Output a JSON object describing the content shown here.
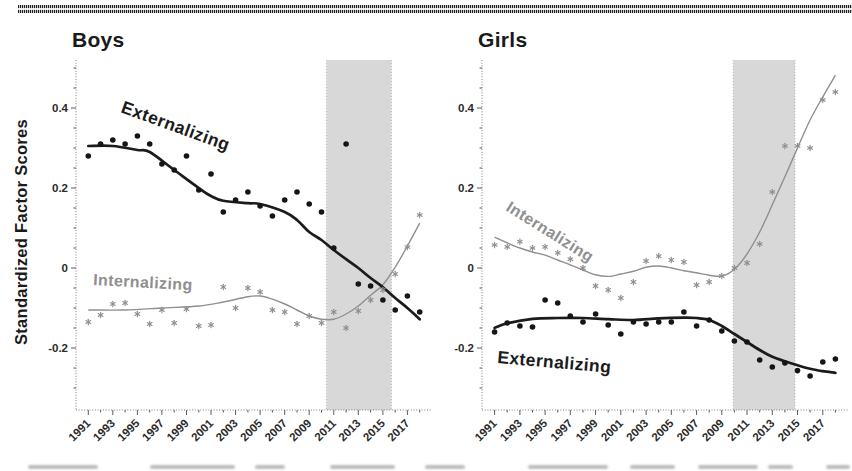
{
  "figure": {
    "ylabel": "Standardized Factor Scores",
    "panel_titles": [
      "Boys",
      "Girls"
    ],
    "curve_labels": [
      "Externalizing",
      "Internalizing"
    ],
    "ytick_labels": [
      "-0.2",
      "0",
      "0.2",
      "0.4"
    ],
    "xtick_labels": [
      "1991",
      "1993",
      "1995",
      "1997",
      "1999",
      "2001",
      "2003",
      "2005",
      "2007",
      "2009",
      "2011",
      "2013",
      "2015",
      "2017"
    ],
    "colors": {
      "externalizing": "#1b1b1b",
      "internalizing": "#8f8f8f",
      "shaded_band": "#d8d8d8"
    }
  },
  "chart_data": [
    {
      "type": "scatter",
      "title": "Boys",
      "xlabel": "",
      "ylabel": "Standardized Factor Scores",
      "x_range": [
        1990,
        2019
      ],
      "ylim": [
        -0.355,
        0.52
      ],
      "yticks": [
        -0.2,
        0,
        0.2,
        0.4
      ],
      "xticks": [
        1991,
        1993,
        1995,
        1997,
        1999,
        2001,
        2003,
        2005,
        2007,
        2009,
        2011,
        2013,
        2015,
        2017
      ],
      "grid": false,
      "legend": "inline curve labels",
      "shaded_region": {
        "from": 2010.4,
        "to": 2015.7
      },
      "years": [
        1991,
        1992,
        1993,
        1994,
        1995,
        1996,
        1997,
        1998,
        1999,
        2000,
        2001,
        2002,
        2003,
        2004,
        2005,
        2006,
        2007,
        2008,
        2009,
        2010,
        2011,
        2012,
        2013,
        2014,
        2015,
        2016,
        2017,
        2018
      ],
      "series": [
        {
          "name": "Externalizing",
          "marker": "filled-circle",
          "color": "#1b1b1b",
          "values": [
            0.28,
            0.31,
            0.32,
            0.31,
            0.33,
            0.31,
            0.26,
            0.245,
            0.28,
            0.195,
            0.235,
            0.14,
            0.17,
            0.19,
            0.155,
            0.13,
            0.17,
            0.19,
            0.16,
            0.14,
            0.05,
            0.31,
            -0.04,
            -0.045,
            -0.08,
            -0.105,
            -0.07,
            -0.11
          ],
          "trend": [
            [
              1991,
              0.305
            ],
            [
              1993,
              0.305
            ],
            [
              1995,
              0.295
            ],
            [
              1996,
              0.29
            ],
            [
              1998,
              0.245
            ],
            [
              2000,
              0.2
            ],
            [
              2001,
              0.18
            ],
            [
              2002,
              0.168
            ],
            [
              2004,
              0.162
            ],
            [
              2005,
              0.16
            ],
            [
              2007,
              0.14
            ],
            [
              2008,
              0.12
            ],
            [
              2009,
              0.09
            ],
            [
              2010,
              0.07
            ],
            [
              2011,
              0.045
            ],
            [
              2012,
              0.022
            ],
            [
              2013,
              0.0
            ],
            [
              2014,
              -0.025
            ],
            [
              2015,
              -0.048
            ],
            [
              2016,
              -0.075
            ],
            [
              2017,
              -0.1
            ],
            [
              2018,
              -0.128
            ]
          ]
        },
        {
          "name": "Internalizing",
          "marker": "asterisk",
          "color": "#8f8f8f",
          "values": [
            -0.135,
            -0.1175,
            -0.09,
            -0.0875,
            -0.115,
            -0.14,
            -0.105,
            -0.1375,
            -0.1025,
            -0.145,
            -0.1425,
            -0.0475,
            -0.1,
            -0.05,
            -0.06,
            -0.105,
            -0.11,
            -0.14,
            -0.12,
            -0.1375,
            -0.11,
            -0.15,
            -0.1075,
            -0.08,
            -0.055,
            -0.015,
            0.0525,
            0.1325
          ],
          "trend": [
            [
              1991,
              -0.105
            ],
            [
              1994,
              -0.105
            ],
            [
              1997,
              -0.1
            ],
            [
              2000,
              -0.095
            ],
            [
              2002,
              -0.085
            ],
            [
              2004,
              -0.072
            ],
            [
              2005,
              -0.07
            ],
            [
              2006,
              -0.078
            ],
            [
              2007,
              -0.09
            ],
            [
              2008,
              -0.105
            ],
            [
              2009,
              -0.12
            ],
            [
              2010,
              -0.128
            ],
            [
              2011,
              -0.128
            ],
            [
              2012,
              -0.115
            ],
            [
              2013,
              -0.095
            ],
            [
              2014,
              -0.068
            ],
            [
              2015,
              -0.042
            ],
            [
              2016,
              0.002
            ],
            [
              2017,
              0.055
            ],
            [
              2018,
              0.112
            ]
          ]
        }
      ]
    },
    {
      "type": "scatter",
      "title": "Girls",
      "xlabel": "",
      "ylabel": "Standardized Factor Scores",
      "x_range": [
        1990,
        2019
      ],
      "ylim": [
        -0.355,
        0.52
      ],
      "yticks": [
        -0.2,
        0,
        0.2,
        0.4
      ],
      "xticks": [
        1991,
        1993,
        1995,
        1997,
        1999,
        2001,
        2003,
        2005,
        2007,
        2009,
        2011,
        2013,
        2015,
        2017
      ],
      "grid": false,
      "legend": "inline curve labels",
      "shaded_region": {
        "from": 2009.9,
        "to": 2014.8
      },
      "years": [
        1991,
        1992,
        1993,
        1994,
        1995,
        1996,
        1997,
        1998,
        1999,
        2000,
        2001,
        2002,
        2003,
        2004,
        2005,
        2006,
        2007,
        2008,
        2009,
        2010,
        2011,
        2012,
        2013,
        2014,
        2015,
        2016,
        2017,
        2018
      ],
      "series": [
        {
          "name": "Externalizing",
          "marker": "filled-circle",
          "color": "#1b1b1b",
          "values": [
            -0.16,
            -0.1375,
            -0.145,
            -0.1475,
            -0.08,
            -0.0875,
            -0.12,
            -0.135,
            -0.115,
            -0.1425,
            -0.165,
            -0.135,
            -0.14,
            -0.135,
            -0.135,
            -0.11,
            -0.145,
            -0.13,
            -0.1575,
            -0.1825,
            -0.185,
            -0.23,
            -0.2475,
            -0.2375,
            -0.2565,
            -0.27,
            -0.235,
            -0.2275
          ],
          "trend": [
            [
              1991,
              -0.15
            ],
            [
              1992,
              -0.138
            ],
            [
              1994,
              -0.127
            ],
            [
              1996,
              -0.125
            ],
            [
              1998,
              -0.125
            ],
            [
              2000,
              -0.128
            ],
            [
              2002,
              -0.13
            ],
            [
              2004,
              -0.126
            ],
            [
              2006,
              -0.124
            ],
            [
              2007,
              -0.125
            ],
            [
              2008,
              -0.13
            ],
            [
              2009,
              -0.145
            ],
            [
              2010,
              -0.165
            ],
            [
              2011,
              -0.185
            ],
            [
              2012,
              -0.205
            ],
            [
              2013,
              -0.222
            ],
            [
              2014,
              -0.233
            ],
            [
              2015,
              -0.243
            ],
            [
              2016,
              -0.252
            ],
            [
              2017,
              -0.258
            ],
            [
              2018,
              -0.262
            ]
          ]
        },
        {
          "name": "Internalizing",
          "marker": "asterisk",
          "color": "#8f8f8f",
          "values": [
            0.0575,
            0.053,
            0.066,
            0.05,
            0.053,
            0.038,
            0.022,
            0.0,
            -0.045,
            -0.055,
            -0.075,
            -0.035,
            0.0175,
            0.03,
            0.02,
            0.015,
            -0.0425,
            -0.035,
            -0.02,
            0.0,
            0.0125,
            0.06,
            0.19,
            0.305,
            0.305,
            0.3,
            0.42,
            0.44
          ],
          "trend": [
            [
              1991,
              0.077
            ],
            [
              1992,
              0.063
            ],
            [
              1993,
              0.05
            ],
            [
              1994,
              0.04
            ],
            [
              1995,
              0.032
            ],
            [
              1996,
              0.02
            ],
            [
              1997,
              0.008
            ],
            [
              1998,
              -0.005
            ],
            [
              1999,
              -0.017
            ],
            [
              2000,
              -0.021
            ],
            [
              2001,
              -0.015
            ],
            [
              2002,
              -0.008
            ],
            [
              2003,
              0.002
            ],
            [
              2004,
              0.005
            ],
            [
              2005,
              0.0
            ],
            [
              2006,
              -0.007
            ],
            [
              2007,
              -0.012
            ],
            [
              2008,
              -0.018
            ],
            [
              2009,
              -0.02
            ],
            [
              2010,
              -0.003
            ],
            [
              2011,
              0.035
            ],
            [
              2012,
              0.09
            ],
            [
              2013,
              0.158
            ],
            [
              2014,
              0.228
            ],
            [
              2015,
              0.3
            ],
            [
              2016,
              0.37
            ],
            [
              2017,
              0.428
            ],
            [
              2018,
              0.482
            ]
          ]
        }
      ]
    }
  ]
}
